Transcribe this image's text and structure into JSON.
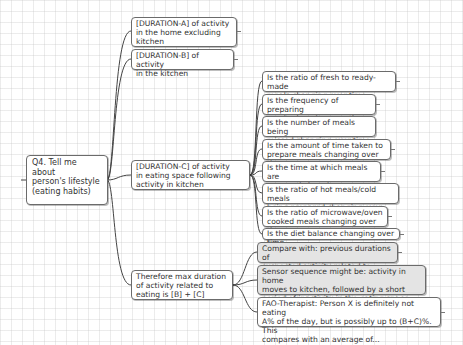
{
  "diagram": {
    "type": "mind-map",
    "root": {
      "id": "root",
      "label": "Q4. Tell me about\nperson's lifestyle\n(eating habits)"
    },
    "branches": [
      {
        "id": "duration_a",
        "label": "[DURATION-A] of activity\nin the home excluding\nkitchen",
        "children": []
      },
      {
        "id": "duration_b",
        "label": "[DURATION-B] of activity\nin the kitchen",
        "children": []
      },
      {
        "id": "duration_c",
        "label": "[DURATION-C] of activity\nin eating space following\nactivity in kitchen",
        "children": [
          {
            "id": "c1",
            "label": "Is the ratio of fresh to ready-made\nmeals changing over time"
          },
          {
            "id": "c2",
            "label": "Is the frequency of preparing\nmeals changing over time"
          },
          {
            "id": "c3",
            "label": "Is the number of meals being\nmissed changing over time"
          },
          {
            "id": "c4",
            "label": "Is the amount of time taken to\nprepare meals changing over time"
          },
          {
            "id": "c5",
            "label": "Is the time at which meals are\nprepared changing over time"
          },
          {
            "id": "c6",
            "label": "Is the ratio of hot meals/cold meals\nbeing prepared changing over time"
          },
          {
            "id": "c7",
            "label": "Is the ratio of microwave/oven\ncooked meals changing over time"
          },
          {
            "id": "c8",
            "label": "Is the diet balance changing over time"
          }
        ]
      },
      {
        "id": "therefore",
        "label": "Therefore max duration\nof activity related to\neating is [B] + [C]",
        "children": [
          {
            "id": "t1",
            "label": "Compare with: previous durations of\nsuspected activity related to eating",
            "style": "gray"
          },
          {
            "id": "t2",
            "label": "Sensor sequence might be: activity in home\nmoves to kitchen, followed by a short\nperiod of inactivity in the eating space",
            "style": "gray"
          },
          {
            "id": "t3",
            "label": "FAO-Therapist: Person X is definitely not eating\nA% of the day, but is possibly up to (B+C)%. This\ncompares with an average of...",
            "style": "white"
          }
        ]
      }
    ]
  },
  "colors": {
    "background": "#ffffff",
    "grid": "#dcdcdc",
    "node_border": "#6b6b6b",
    "node_fill": "#ffffff",
    "note_fill": "#e4e4e4",
    "link": "#444444",
    "text": "#333333"
  }
}
